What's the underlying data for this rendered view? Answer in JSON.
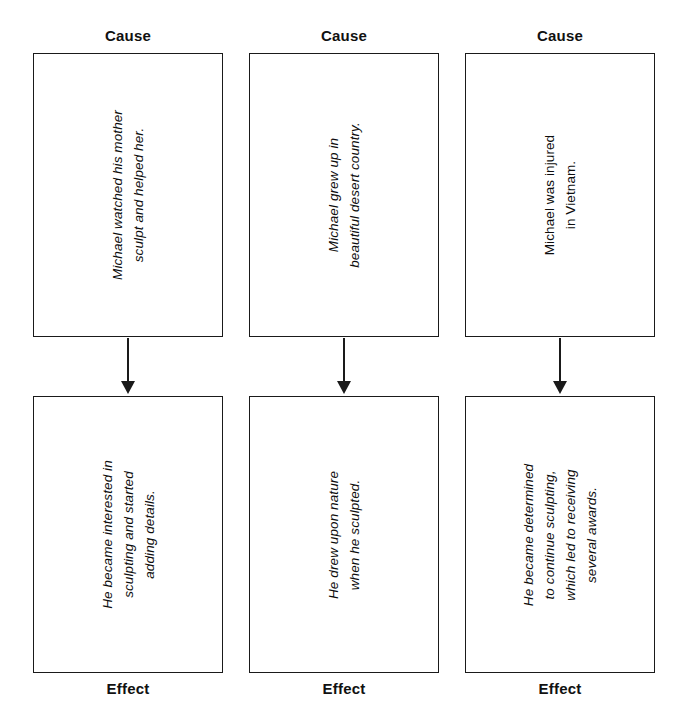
{
  "diagram": {
    "type": "cause-and-effect-chart",
    "columns": [
      {
        "cause_label": "Cause",
        "cause_text": "Michael watched his mother\nsculpt and helped her.",
        "cause_italic": true,
        "effect_label": "Effect",
        "effect_text": "He became interested in\nsculpting and started\nadding details.",
        "effect_italic": true
      },
      {
        "cause_label": "Cause",
        "cause_text": "Michael grew up in\nbeautiful desert country.",
        "cause_italic": true,
        "effect_label": "Effect",
        "effect_text": "He drew upon nature\nwhen he sculpted.",
        "effect_italic": true
      },
      {
        "cause_label": "Cause",
        "cause_text": "Michael was injured\nin Vietnam.",
        "cause_italic": false,
        "effect_label": "Effect",
        "effect_text": "He became determined\nto continue sculpting,\nwhich led to receiving\nseveral awards.",
        "effect_italic": true
      }
    ],
    "colors": {
      "background": "#ffffff",
      "box_border": "#1a1a1a",
      "text": "#0d0d0d",
      "arrow": "#1a1a1a"
    }
  }
}
